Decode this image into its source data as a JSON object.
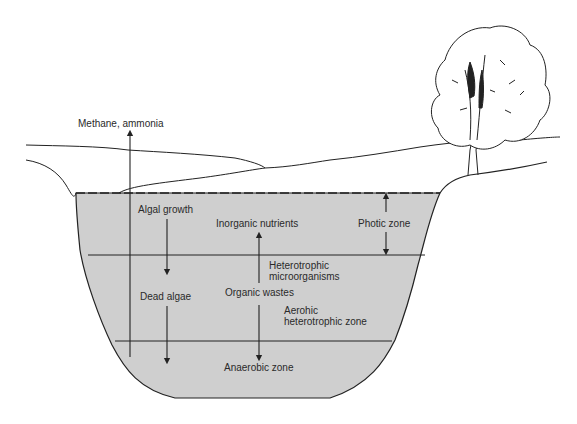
{
  "diagram": {
    "type": "lake-stratification",
    "colors": {
      "water": "#cfcfcf",
      "line": "#222222",
      "background": "#ffffff"
    },
    "labels": {
      "methane_ammonia": "Methane, ammonia",
      "algal_growth": "Algal growth",
      "inorganic_nutrients": "Inorganic nutrients",
      "photic_zone": "Photic zone",
      "heterotrophic_1": "Heterotrophic",
      "heterotrophic_2": "microorganisms",
      "dead_algae": "Dead algae",
      "organic_wastes": "Organic wastes",
      "aerobic_1": "Aerohic",
      "aerobic_2": "heterotrophic zone",
      "anaerobic_zone": "Anaerobic zone"
    },
    "zones": [
      "Photic zone",
      "Aerohic heterotrophic zone",
      "Anaerobic zone"
    ],
    "arrows": [
      {
        "from": "lake bottom",
        "to": "Methane, ammonia",
        "direction": "up"
      },
      {
        "from": "Algal growth",
        "to": "Dead algae",
        "direction": "down"
      },
      {
        "from": "Dead algae",
        "to": "Anaerobic zone",
        "direction": "down"
      },
      {
        "from": "Organic wastes",
        "to": "Inorganic nutrients",
        "direction": "up"
      },
      {
        "from": "Organic wastes",
        "to": "Anaerobic zone",
        "direction": "down"
      },
      {
        "from": "Photic zone",
        "to": "water surface",
        "direction": "up"
      },
      {
        "from": "Photic zone",
        "to": "photic boundary",
        "direction": "down"
      }
    ],
    "decorations": [
      "tree-icon",
      "hillside-lines"
    ]
  }
}
